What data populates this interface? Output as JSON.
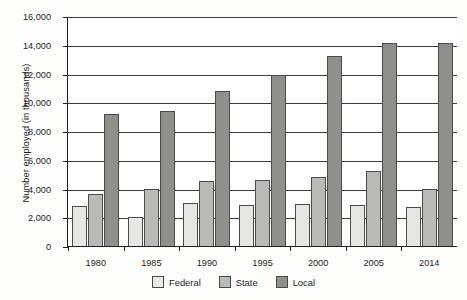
{
  "chart_data": {
    "type": "bar",
    "title": "",
    "subtitle": "",
    "xlabel": "",
    "ylabel": "Number employed (in thousands)",
    "categories": [
      "1980",
      "1985",
      "1990",
      "1995",
      "2000",
      "2005",
      "2014"
    ],
    "series": [
      {
        "name": "Federal",
        "color": "#e6e6e3",
        "values": [
          2800,
          2000,
          3000,
          2850,
          2900,
          2850,
          2700
        ]
      },
      {
        "name": "State",
        "color": "#b9b9b6",
        "values": [
          3600,
          4000,
          4500,
          4600,
          4800,
          5200,
          4000
        ]
      },
      {
        "name": "Local",
        "color": "#8f8f8c",
        "values": [
          9200,
          9400,
          10800,
          11900,
          13200,
          14100,
          14100
        ]
      }
    ],
    "ylim": [
      0,
      16000
    ],
    "ytick_step": 2000,
    "ytick_labels": [
      "0",
      "2,000",
      "4,000",
      "6,000",
      "8,000",
      "10,000",
      "12,000",
      "14,000",
      "16,000"
    ],
    "ytick_values": [
      0,
      2000,
      4000,
      6000,
      8000,
      10000,
      12000,
      14000,
      16000
    ],
    "grid": true,
    "legend_position": "bottom"
  }
}
